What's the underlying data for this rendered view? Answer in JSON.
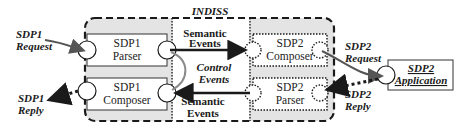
{
  "diagram": {
    "title": "INDISS",
    "left_labels": {
      "request": [
        "SDP1",
        "Request"
      ],
      "reply": [
        "SDP1",
        "Reply"
      ]
    },
    "right_labels": {
      "request": [
        "SDP2",
        "Request"
      ],
      "reply": [
        "SDP2",
        "Reply"
      ]
    },
    "components": {
      "sdp1_parser": [
        "SDP1",
        "Parser"
      ],
      "sdp1_composer": [
        "SDP1",
        "Composer"
      ],
      "sdp2_composer": [
        "SDP2",
        "Composer"
      ],
      "sdp2_parser": [
        "SDP2",
        "Parser"
      ]
    },
    "events": {
      "semantic_top": [
        "Semantic",
        "Events"
      ],
      "control": [
        "Control",
        "Events"
      ],
      "semantic_bottom": [
        "Semantic",
        "Events"
      ]
    },
    "application": [
      "SDP2",
      "Application"
    ],
    "colors": {
      "fill_gray": "#e4e4e4",
      "stroke": "#1a1a1a",
      "control_arrow": "#8a8a8a",
      "request_arrow": "#555555"
    }
  }
}
